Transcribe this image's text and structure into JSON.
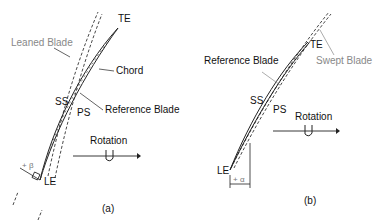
{
  "panel_a": {
    "caption": "(a)",
    "labels": {
      "te": "TE",
      "le": "LE",
      "leaned_blade": "Leaned Blade",
      "chord": "Chord",
      "ss": "SS",
      "ps": "PS",
      "reference_blade": "Reference Blade",
      "rotation": "Rotation",
      "angle": "+ β"
    }
  },
  "panel_b": {
    "caption": "(b)",
    "labels": {
      "te": "TE",
      "le": "LE",
      "swept_blade": "Swept Blade",
      "reference_blade": "Reference Blade",
      "ss": "SS",
      "ps": "PS",
      "rotation": "Rotation",
      "angle": "+ α"
    }
  },
  "colors": {
    "line": "#222222",
    "secondary_label": "#888888"
  }
}
